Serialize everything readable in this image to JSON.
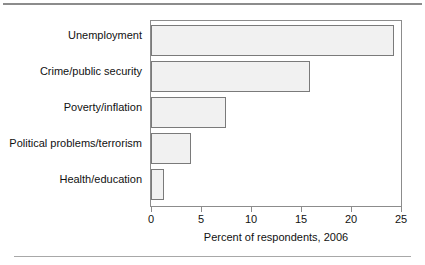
{
  "chart_data": {
    "type": "bar",
    "orientation": "horizontal",
    "title": "",
    "subtitle": "",
    "xlabel": "Percent of respondents, 2006",
    "ylabel": "",
    "categories": [
      "Unemployment",
      "Crime/public security",
      "Poverty/inflation",
      "Political problems/terrorism",
      "Health/education"
    ],
    "values": [
      24.3,
      15.9,
      7.5,
      4.0,
      1.3
    ],
    "xlim": [
      0,
      25
    ],
    "xticks": [
      0,
      5,
      10,
      15,
      20,
      25
    ],
    "xtick_labels": [
      "0",
      "5",
      "10",
      "15",
      "20",
      "25"
    ],
    "grid": false,
    "legend": null,
    "bar_fill": "#f1f1f1",
    "bar_border": "#7a7a7a",
    "frame_color": "#8c8c8c"
  }
}
